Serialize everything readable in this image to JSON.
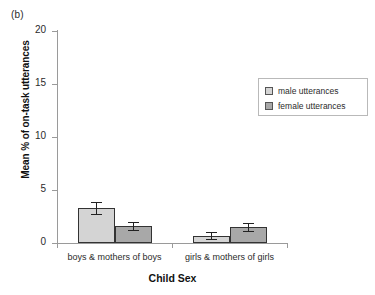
{
  "panel": {
    "label": "(b)"
  },
  "chart_data": {
    "type": "bar",
    "title": "",
    "subtitle": "",
    "xlabel": "Child Sex",
    "ylabel": "Mean % of on-task utterances",
    "ylim": [
      0,
      20
    ],
    "yticks": [
      0,
      5,
      10,
      15,
      20
    ],
    "ytick_labels": [
      "0",
      "5",
      "10",
      "15",
      "20"
    ],
    "grid": false,
    "legend_position": "upper right",
    "categories": [
      "boys & mothers of boys",
      "girls & mothers of girls"
    ],
    "series": [
      {
        "name": "male utterances",
        "color": "#d4d4d4",
        "values": [
          3.3,
          0.7
        ],
        "errors": [
          0.55,
          0.35
        ]
      },
      {
        "name": "female utterances",
        "color": "#a8a8a8",
        "values": [
          1.6,
          1.5
        ],
        "errors": [
          0.4,
          0.4
        ]
      }
    ],
    "legend": [
      "male utterances",
      "female utterances"
    ],
    "annotations": [
      "(b)"
    ]
  },
  "legend": {
    "items": [
      {
        "label": "male utterances",
        "color": "#d4d4d4"
      },
      {
        "label": "female utterances",
        "color": "#a8a8a8"
      }
    ]
  },
  "axis": {
    "y_title": "Mean % of on-task utterances",
    "x_title": "Child Sex",
    "y_labels": [
      "20",
      "15",
      "10",
      "5",
      "0"
    ],
    "x_labels": [
      "boys & mothers of boys",
      "girls & mothers of girls"
    ]
  },
  "colors": {
    "male_bar": "#d4d4d4",
    "female_bar": "#a8a8a8",
    "bar_outline": "#333333",
    "axis": "#9a9a9a",
    "text": "#2b2b2b",
    "background": "#ffffff"
  }
}
